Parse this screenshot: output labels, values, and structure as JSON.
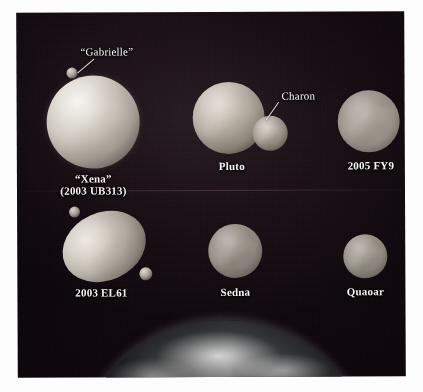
{
  "figure": {
    "kind": "astronomy-size-comparison-photo",
    "background": "#0f0a0e",
    "label_color": "#f6f4f0"
  },
  "objects": [
    {
      "id": "xena",
      "name": "“Xena”",
      "designation": "(2003 UB313)",
      "row": 1,
      "column": 1,
      "moons": [
        {
          "id": "gabrielle",
          "name": "“Gabrielle”",
          "callout": true
        }
      ]
    },
    {
      "id": "pluto",
      "name": "Pluto",
      "designation": "",
      "row": 1,
      "column": 2,
      "moons": [
        {
          "id": "charon",
          "name": "Charon",
          "callout": true
        }
      ]
    },
    {
      "id": "fy9",
      "name": "2005 FY9",
      "designation": "",
      "row": 1,
      "column": 3,
      "moons": []
    },
    {
      "id": "el61",
      "name": "2003 EL61",
      "designation": "",
      "row": 2,
      "column": 1,
      "moons": [
        {
          "id": "el61-moon-a",
          "name": "",
          "callout": false
        },
        {
          "id": "el61-moon-b",
          "name": "",
          "callout": false
        }
      ]
    },
    {
      "id": "sedna",
      "name": "Sedna",
      "designation": "",
      "row": 2,
      "column": 2,
      "moons": []
    },
    {
      "id": "quaoar",
      "name": "Quaoar",
      "designation": "",
      "row": 2,
      "column": 3,
      "moons": []
    }
  ],
  "labels": {
    "xena": "“Xena”",
    "xena_designation": "(2003 UB313)",
    "gabrielle": "“Gabrielle”",
    "pluto": "Pluto",
    "charon": "Charon",
    "fy9": "2005 FY9",
    "el61": "2003 EL61",
    "sedna": "Sedna",
    "quaoar": "Quaoar"
  },
  "earth": {
    "name": "Earth",
    "visible_portion": "upper limb / horizon arc"
  }
}
